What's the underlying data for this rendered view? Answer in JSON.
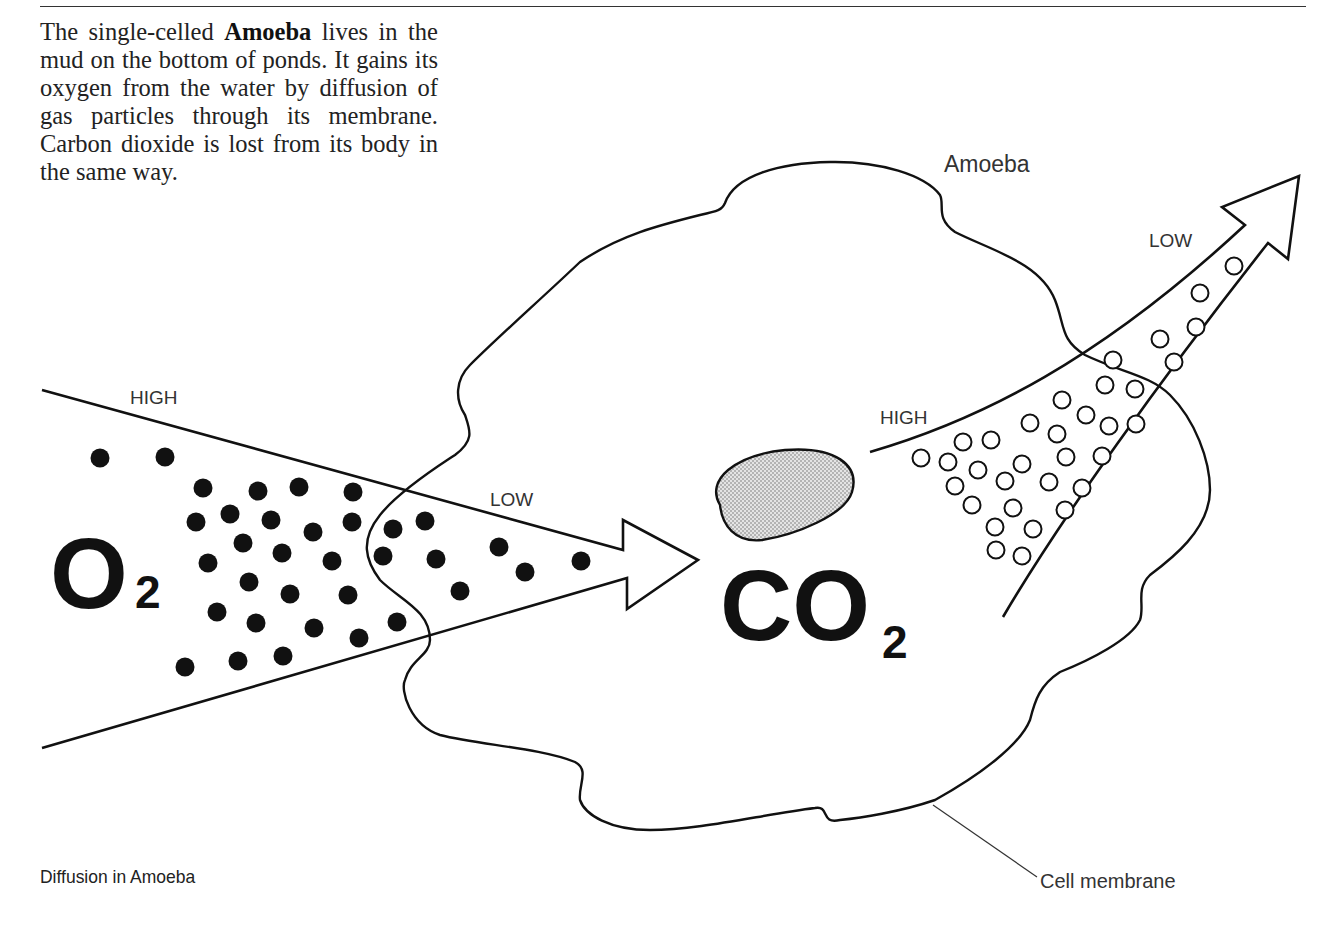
{
  "intro": {
    "before_bold": "The single-celled ",
    "bold": "Amoeba",
    "after_bold": " lives in the mud on the bottom of ponds. It gains its oxygen from the water by diffusion of gas particles through its membrane. Carbon dioxide is lost from its body in the same way."
  },
  "caption": "Diffusion in Amoeba",
  "labels": {
    "organism": "Amoeba",
    "membrane": "Cell membrane",
    "o2_high": "HIGH",
    "o2_low": "LOW",
    "co2_high": "HIGH",
    "co2_low": "LOW"
  },
  "formulas": {
    "oxygen": {
      "base": "O",
      "sub": "2"
    },
    "carbon_dioxide": {
      "base": "CO",
      "sub": "2"
    }
  },
  "colors": {
    "line": "#111111",
    "nucleus_fill": "#c8c8c8",
    "particle_o2": "#111111",
    "particle_co2": "#ffffff"
  }
}
